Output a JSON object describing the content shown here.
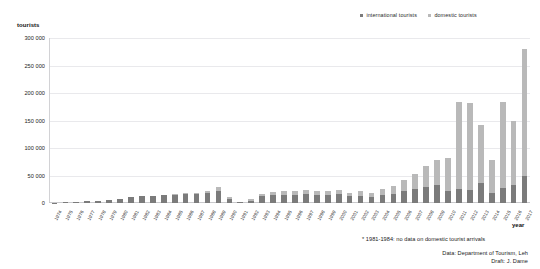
{
  "chart_data": {
    "type": "bar",
    "stacked": true,
    "title": "",
    "xlabel": "year",
    "ylabel": "tourists",
    "ylim": [
      0,
      300000
    ],
    "yticks": [
      0,
      50000,
      100000,
      150000,
      200000,
      250000,
      300000
    ],
    "ytick_labels": [
      "0",
      "50 000",
      "100 000",
      "150 000",
      "200 000",
      "250 000",
      "300 000"
    ],
    "grid": true,
    "legend_position": "top-right",
    "colors": {
      "international": "#7b7b7b",
      "domestic": "#b9b9b9",
      "gridline": "#e9e9ec",
      "axis": "#c9c9cc",
      "text": "#1a1a1a"
    },
    "legend": [
      {
        "name": "international tourists",
        "color": "#7b7b7b"
      },
      {
        "name": "domestic tourists",
        "color": "#b9b9b9"
      }
    ],
    "categories": [
      "1974",
      "1975",
      "1976",
      "1977",
      "1978",
      "1979",
      "1980",
      "1981",
      "1982",
      "1983",
      "1984",
      "1985",
      "1986",
      "1987",
      "1988",
      "1989",
      "1990",
      "1991",
      "1992",
      "1993",
      "1994",
      "1995",
      "1996",
      "1997",
      "1998",
      "1999",
      "2000",
      "2001",
      "2002",
      "2003",
      "2004",
      "2005",
      "2006",
      "2007",
      "2008",
      "2009",
      "2010",
      "2011",
      "2012",
      "2013",
      "2014",
      "2015",
      "2016",
      "2017"
    ],
    "series": [
      {
        "name": "international tourists",
        "color": "#7b7b7b",
        "values": [
          500,
          1200,
          2000,
          3000,
          4500,
          6000,
          8000,
          11000,
          12000,
          13000,
          14000,
          15000,
          16000,
          15500,
          18000,
          21000,
          8000,
          1000,
          3500,
          12000,
          14000,
          15000,
          14500,
          16000,
          15000,
          14500,
          15500,
          12000,
          13000,
          11000,
          15000,
          17000,
          21000,
          25000,
          30000,
          33000,
          22000,
          25000,
          24000,
          37000,
          19000,
          27000,
          33000,
          49000
        ]
      },
      {
        "name": "domestic tourists",
        "color": "#b9b9b9",
        "values": [
          0,
          0,
          0,
          0,
          0,
          0,
          0,
          0,
          0,
          0,
          0,
          2000,
          2500,
          2500,
          4000,
          9000,
          3000,
          1500,
          3000,
          5000,
          6000,
          6500,
          7000,
          7500,
          7000,
          7000,
          7500,
          7000,
          8000,
          7500,
          11000,
          14000,
          21000,
          28000,
          37000,
          45000,
          60000,
          158000,
          158000,
          104000,
          60000,
          157000,
          117000,
          231000
        ]
      }
    ],
    "totals": [
      500,
      1200,
      2000,
      3000,
      4500,
      6000,
      8000,
      11000,
      12000,
      13000,
      14000,
      17000,
      18500,
      18000,
      22000,
      30000,
      11000,
      2500,
      6500,
      17000,
      20000,
      21500,
      21500,
      23500,
      22000,
      21500,
      23000,
      19000,
      21000,
      18500,
      26000,
      31000,
      42000,
      53000,
      67000,
      78000,
      82000,
      183000,
      182000,
      141000,
      79000,
      184000,
      150000,
      280000
    ],
    "annotations": [
      "* 1981-1984: no data on domestic tourist arrivals"
    ],
    "credits": {
      "data_source": "Data: Department of Tourism, Leh",
      "draft": "Draft: J. Dame"
    }
  }
}
